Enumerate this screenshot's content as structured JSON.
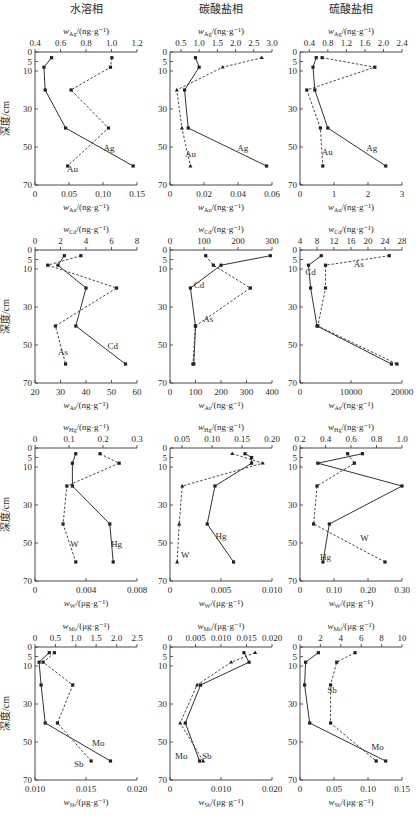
{
  "figure": {
    "column_titles": [
      "水溶相",
      "碳酸盐相",
      "硫酸盐相"
    ],
    "y_axis_label": "深度/cm",
    "y_ticks": [
      0,
      5,
      10,
      30,
      50,
      70
    ],
    "y_range": [
      0,
      70
    ]
  },
  "chart_data": [
    {
      "type": "line",
      "row": 0,
      "col": 0,
      "title": "水溶相",
      "ylabel": "深度/cm",
      "depth": [
        3,
        8,
        20,
        40,
        60
      ],
      "top_axis": {
        "label": "w_Ag/(ng·g⁻¹)",
        "element": "Ag",
        "range": [
          0.4,
          1.2
        ],
        "ticks": [
          "0.4",
          "0.6",
          "0.8",
          "1.0",
          "1.2"
        ]
      },
      "bottom_axis": {
        "label": "w_Au/(ng·g⁻¹)",
        "element": "Au",
        "range": [
          0,
          0.15
        ],
        "ticks": [
          "0",
          "0.05",
          "0.10",
          "0.15"
        ]
      },
      "series": [
        {
          "name": "Ag",
          "axis": "top",
          "style": "solid",
          "values": [
            0.53,
            0.47,
            0.48,
            0.64,
            1.17
          ],
          "label_pos": [
            0.98,
            52
          ]
        },
        {
          "name": "Au",
          "axis": "bottom",
          "style": "dashed",
          "values": [
            0.113,
            0.111,
            0.053,
            0.108,
            0.048
          ],
          "label_pos": [
            0.055,
            63
          ]
        }
      ]
    },
    {
      "type": "line",
      "row": 0,
      "col": 1,
      "title": "碳酸盐相",
      "depth": [
        3,
        8,
        20,
        40,
        60
      ],
      "top_axis": {
        "label": "w_Ag/(ng·g⁻¹)",
        "element": "Ag",
        "range": [
          0.2,
          3.0
        ],
        "ticks": [
          "0.5",
          "1.0",
          "1.5",
          "2.0",
          "2.5",
          "3.0"
        ]
      },
      "bottom_axis": {
        "label": "w_Au/(ng·g⁻¹)",
        "element": "Au",
        "range": [
          0,
          0.06
        ],
        "ticks": [
          "0",
          "0.02",
          "0.04",
          "0.06"
        ]
      },
      "series": [
        {
          "name": "Ag",
          "axis": "top",
          "style": "solid",
          "values": [
            0.9,
            1.0,
            0.6,
            0.7,
            2.85
          ],
          "label_pos": [
            2.2,
            52
          ]
        },
        {
          "name": "Au",
          "axis": "bottom",
          "style": "dashed",
          "values": [
            0.054,
            0.031,
            0.004,
            0.007,
            0.012
          ],
          "label_pos": [
            0.012,
            55
          ]
        }
      ]
    },
    {
      "type": "line",
      "row": 0,
      "col": 2,
      "title": "硫酸盐相",
      "depth": [
        3,
        8,
        20,
        40,
        60
      ],
      "top_axis": {
        "label": "w_Ag/(ng·g⁻¹)",
        "element": "Ag",
        "range": [
          0.2,
          2.4
        ],
        "ticks": [
          "0.4",
          "0.8",
          "1.2",
          "1.6",
          "2.0",
          "2.4"
        ]
      },
      "bottom_axis": {
        "label": "w_Au/(ng·g⁻¹)",
        "element": "Au",
        "range": [
          0,
          3
        ],
        "ticks": [
          "0",
          "1",
          "2",
          "3"
        ]
      },
      "series": [
        {
          "name": "Ag",
          "axis": "top",
          "style": "solid",
          "values": [
            0.55,
            0.48,
            0.52,
            0.8,
            2.05
          ],
          "label_pos": [
            1.75,
            52
          ]
        },
        {
          "name": "Au",
          "axis": "bottom",
          "style": "dashed",
          "values": [
            0.65,
            2.2,
            0.2,
            0.6,
            0.67
          ],
          "label_pos": [
            0.8,
            54
          ]
        }
      ]
    },
    {
      "type": "line",
      "row": 1,
      "col": 0,
      "ylabel": "深度/cm",
      "depth": [
        3,
        8,
        20,
        40,
        60
      ],
      "top_axis": {
        "label": "w_Cd/(ng·g⁻¹)",
        "element": "Cd",
        "range": [
          0,
          8
        ],
        "ticks": [
          "0",
          "2",
          "4",
          "6",
          "8"
        ]
      },
      "bottom_axis": {
        "label": "w_As/(ng·g⁻¹)",
        "element": "As",
        "range": [
          20,
          60
        ],
        "ticks": [
          "20",
          "30",
          "40",
          "50",
          "60"
        ]
      },
      "series": [
        {
          "name": "Cd",
          "axis": "top",
          "style": "solid",
          "values": [
            2.3,
            1.8,
            4.0,
            3.2,
            7.1
          ],
          "label_pos": [
            6.1,
            52
          ]
        },
        {
          "name": "As",
          "axis": "bottom",
          "style": "dashed",
          "values": [
            38,
            25,
            52,
            28,
            32
          ],
          "label_pos": [
            31,
            55
          ]
        }
      ]
    },
    {
      "type": "line",
      "row": 1,
      "col": 1,
      "depth": [
        3,
        8,
        20,
        40,
        60
      ],
      "top_axis": {
        "label": "w_Cd/(ng·g⁻¹)",
        "element": "Cd",
        "range": [
          0,
          300
        ],
        "ticks": [
          "0",
          "100",
          "200",
          "300"
        ]
      },
      "bottom_axis": {
        "label": "w_As/(ng·g⁻¹)",
        "element": "As",
        "range": [
          0,
          400
        ],
        "ticks": [
          "0",
          "100",
          "200",
          "300",
          "400"
        ]
      },
      "series": [
        {
          "name": "Cd",
          "axis": "top",
          "style": "solid",
          "values": [
            295,
            150,
            60,
            75,
            70
          ],
          "label_pos": [
            85,
            20
          ]
        },
        {
          "name": "As",
          "axis": "bottom",
          "style": "dashed",
          "values": [
            140,
            170,
            315,
            100,
            90
          ],
          "label_pos": [
            150,
            38
          ]
        }
      ]
    },
    {
      "type": "line",
      "row": 1,
      "col": 2,
      "depth": [
        3,
        8,
        20,
        40,
        60
      ],
      "top_axis": {
        "label": "w_Cd/(ng·g⁻¹)",
        "element": "Cd",
        "range": [
          4,
          28
        ],
        "ticks": [
          "4",
          "8",
          "12",
          "16",
          "20",
          "24",
          "28"
        ]
      },
      "bottom_axis": {
        "label": "w_As/(ng·g⁻¹)",
        "element": "As",
        "range": [
          0,
          20000
        ],
        "ticks": [
          "0",
          "10000",
          "20000"
        ]
      },
      "series": [
        {
          "name": "Cd",
          "axis": "top",
          "style": "solid",
          "values": [
            9,
            6,
            6.5,
            8,
            25.5
          ],
          "label_pos": [
            6.5,
            13
          ]
        },
        {
          "name": "As",
          "axis": "bottom",
          "style": "dashed",
          "values": [
            17500,
            5000,
            5000,
            3500,
            19000
          ],
          "label_pos": [
            11500,
            9
          ]
        }
      ]
    },
    {
      "type": "line",
      "row": 2,
      "col": 0,
      "ylabel": "深度/cm",
      "depth": [
        3,
        8,
        20,
        40,
        60
      ],
      "top_axis": {
        "label": "w_Hg/(ng·g⁻¹)",
        "element": "Hg",
        "range": [
          0,
          0.3
        ],
        "ticks": [
          "0",
          "0.1",
          "0.2",
          "0.3"
        ]
      },
      "bottom_axis": {
        "label": "w_W/(μg·g⁻¹)",
        "element": "W",
        "range": [
          0,
          0.008
        ],
        "ticks": [
          "0",
          "0.004",
          "0.008"
        ]
      },
      "series": [
        {
          "name": "Hg",
          "axis": "top",
          "style": "solid",
          "values": [
            0.12,
            0.11,
            0.11,
            0.22,
            0.23
          ],
          "label_pos": [
            0.24,
            52
          ]
        },
        {
          "name": "W",
          "axis": "bottom",
          "style": "dashed",
          "values": [
            0.0051,
            0.0066,
            0.0025,
            0.0022,
            0.0032
          ],
          "label_pos": [
            0.0031,
            52
          ]
        }
      ]
    },
    {
      "type": "line",
      "row": 2,
      "col": 1,
      "depth": [
        3,
        5,
        8,
        20,
        40,
        60
      ],
      "top_axis": {
        "label": "w_Hg/(ng·g⁻¹)",
        "element": "Hg",
        "range": [
          0.03,
          0.2
        ],
        "ticks": [
          "0.05",
          "0.10",
          "0.15",
          "0.20"
        ]
      },
      "bottom_axis": {
        "label": "w_W/(μg·g⁻¹)",
        "element": "W",
        "range": [
          0,
          0.01
        ],
        "ticks": [
          "0",
          "0.005",
          "0.010"
        ]
      },
      "series": [
        {
          "name": "Hg",
          "axis": "top",
          "style": "solid",
          "depth": [
            3,
            5,
            8,
            20,
            40,
            60
          ],
          "values": [
            0.155,
            0.166,
            0.166,
            0.105,
            0.092,
            0.136
          ],
          "label_pos": [
            0.115,
            48
          ]
        },
        {
          "name": "W",
          "axis": "bottom",
          "style": "dashed",
          "depth": [
            3,
            8,
            20,
            40,
            60
          ],
          "values": [
            0.0061,
            0.0091,
            0.0012,
            0.0009,
            0.0007
          ],
          "label_pos": [
            0.0015,
            58
          ]
        }
      ]
    },
    {
      "type": "line",
      "row": 2,
      "col": 2,
      "depth": [
        3,
        8,
        20,
        40,
        60
      ],
      "top_axis": {
        "label": "w_Hg/(ng·g⁻¹)",
        "element": "Hg",
        "range": [
          0.2,
          1.0
        ],
        "ticks": [
          "0.2",
          "0.4",
          "0.6",
          "0.8",
          "1.0"
        ]
      },
      "bottom_axis": {
        "label": "w_W/(μg·g⁻¹)",
        "element": "W",
        "range": [
          0,
          0.3
        ],
        "ticks": [
          "0",
          "0.10",
          "0.20",
          "0.30"
        ]
      },
      "series": [
        {
          "name": "Hg",
          "axis": "top",
          "style": "solid",
          "values": [
            0.69,
            0.34,
            1.0,
            0.43,
            0.38
          ],
          "label_pos": [
            0.4,
            59
          ]
        },
        {
          "name": "W",
          "axis": "bottom",
          "style": "dashed",
          "values": [
            0.14,
            0.16,
            0.05,
            0.04,
            0.25
          ],
          "label_pos": [
            0.19,
            49
          ]
        }
      ]
    },
    {
      "type": "line",
      "row": 3,
      "col": 0,
      "ylabel": "深度/cm",
      "depth": [
        3,
        8,
        20,
        40,
        60
      ],
      "top_axis": {
        "label": "w_Mo/(μg·g⁻¹)",
        "element": "Mo",
        "range": [
          0,
          2.5
        ],
        "ticks": [
          "0",
          "0.5",
          "1.0",
          "1.5",
          "2.0",
          "2.5"
        ]
      },
      "bottom_axis": {
        "label": "w_Sb/(μg·g⁻¹)",
        "element": "Sb",
        "range": [
          0.01,
          0.02
        ],
        "ticks": [
          "0.010",
          "0.015",
          "0.020"
        ]
      },
      "series": [
        {
          "name": "Mo",
          "axis": "top",
          "style": "solid",
          "values": [
            0.35,
            0.1,
            0.15,
            0.25,
            1.85
          ],
          "label_pos": [
            1.55,
            52
          ]
        },
        {
          "name": "Sb",
          "axis": "bottom",
          "style": "dashed",
          "values": [
            0.0119,
            0.0108,
            0.0137,
            0.0122,
            0.0155
          ],
          "label_pos": [
            0.0143,
            63
          ]
        }
      ]
    },
    {
      "type": "line",
      "row": 3,
      "col": 1,
      "depth": [
        3,
        8,
        20,
        40,
        60
      ],
      "top_axis": {
        "label": "w_Mo/(μg·g⁻¹)",
        "element": "Mo",
        "range": [
          0,
          0.02
        ],
        "ticks": [
          "0",
          "0.005",
          "0.010",
          "0.015",
          "0.020"
        ]
      },
      "bottom_axis": {
        "label": "w_Sb/(μg·g⁻¹)",
        "element": "Sb",
        "range": [
          0,
          0.02
        ],
        "ticks": [
          "0",
          "0.010",
          "0.020"
        ]
      },
      "series": [
        {
          "name": "Mo",
          "axis": "top",
          "style": "solid",
          "values": [
            0.0145,
            0.0155,
            0.006,
            0.003,
            0.0058
          ],
          "label_pos": [
            0.0022,
            59
          ]
        },
        {
          "name": "Sb",
          "axis": "bottom",
          "style": "dashed",
          "values": [
            0.0167,
            0.012,
            0.0053,
            0.002,
            0.0065
          ],
          "label_pos": [
            0.0072,
            59
          ]
        }
      ]
    },
    {
      "type": "line",
      "row": 3,
      "col": 2,
      "depth": [
        3,
        8,
        20,
        40,
        60
      ],
      "top_axis": {
        "label": "w_Mo/(μg·g⁻¹)",
        "element": "Mo",
        "range": [
          0,
          10
        ],
        "ticks": [
          "0",
          "2",
          "4",
          "6",
          "8",
          "10"
        ]
      },
      "bottom_axis": {
        "label": "w_Sb/(μg·g⁻¹)",
        "element": "Sb",
        "range": [
          0,
          0.15
        ],
        "ticks": [
          "0",
          "0.05",
          "0.10",
          "0.15"
        ]
      },
      "series": [
        {
          "name": "Mo",
          "axis": "top",
          "style": "solid",
          "values": [
            1.8,
            0.55,
            0.45,
            0.95,
            8.4
          ],
          "label_pos": [
            7.6,
            54
          ]
        },
        {
          "name": "Sb",
          "axis": "bottom",
          "style": "dashed",
          "values": [
            0.081,
            0.054,
            0.045,
            0.045,
            0.112
          ],
          "label_pos": [
            0.047,
            24
          ]
        }
      ]
    }
  ]
}
